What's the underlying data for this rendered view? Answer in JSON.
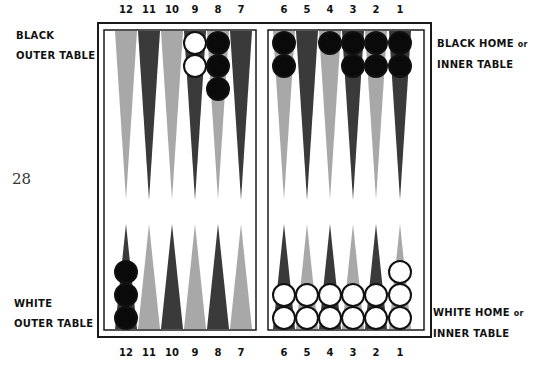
{
  "page_number": "28",
  "labels": {
    "black_outer": [
      "BLACK",
      "OUTER TABLE"
    ],
    "black_home": [
      "BLACK HOME",
      "or",
      "INNER TABLE"
    ],
    "white_outer": [
      "WHITE",
      "OUTER TABLE"
    ],
    "white_home": [
      "WHITE HOME",
      "or",
      "INNER TABLE"
    ]
  },
  "point_numbers": {
    "top": [
      "12",
      "11",
      "10",
      "9",
      "8",
      "7",
      "6",
      "5",
      "4",
      "3",
      "2",
      "1"
    ],
    "bottom": [
      "12",
      "11",
      "10",
      "9",
      "8",
      "7",
      "6",
      "5",
      "4",
      "3",
      "2",
      "1"
    ]
  },
  "colors": {
    "dark_point": "#3a3a3a",
    "light_point": "#a8a8a8",
    "black_checker": "#0a0a0a",
    "white_checker": "#ffffff",
    "frame": "#1a1a1a"
  },
  "board": {
    "top_points": [
      {
        "point": "12",
        "shade": "light",
        "checkers": []
      },
      {
        "point": "11",
        "shade": "dark",
        "checkers": []
      },
      {
        "point": "10",
        "shade": "light",
        "checkers": []
      },
      {
        "point": "9",
        "shade": "dark",
        "checkers": [
          "white",
          "white"
        ]
      },
      {
        "point": "8",
        "shade": "light",
        "checkers": [
          "black",
          "black",
          "black"
        ]
      },
      {
        "point": "7",
        "shade": "dark",
        "checkers": []
      },
      {
        "point": "6",
        "shade": "light",
        "checkers": [
          "black",
          "black"
        ]
      },
      {
        "point": "5",
        "shade": "dark",
        "checkers": []
      },
      {
        "point": "4",
        "shade": "light",
        "checkers": [
          "black"
        ]
      },
      {
        "point": "3",
        "shade": "dark",
        "checkers": [
          "black",
          "black"
        ]
      },
      {
        "point": "2",
        "shade": "light",
        "checkers": [
          "black",
          "black"
        ]
      },
      {
        "point": "1",
        "shade": "dark",
        "checkers": [
          "black",
          "black"
        ]
      }
    ],
    "bottom_points": [
      {
        "point": "12",
        "shade": "dark",
        "checkers": [
          "black",
          "black",
          "black"
        ]
      },
      {
        "point": "11",
        "shade": "light",
        "checkers": []
      },
      {
        "point": "10",
        "shade": "dark",
        "checkers": []
      },
      {
        "point": "9",
        "shade": "light",
        "checkers": []
      },
      {
        "point": "8",
        "shade": "dark",
        "checkers": []
      },
      {
        "point": "7",
        "shade": "light",
        "checkers": []
      },
      {
        "point": "6",
        "shade": "dark",
        "checkers": [
          "white",
          "white"
        ]
      },
      {
        "point": "5",
        "shade": "light",
        "checkers": [
          "white",
          "white"
        ]
      },
      {
        "point": "4",
        "shade": "dark",
        "checkers": [
          "white",
          "white"
        ]
      },
      {
        "point": "3",
        "shade": "light",
        "checkers": [
          "white",
          "white"
        ]
      },
      {
        "point": "2",
        "shade": "dark",
        "checkers": [
          "white",
          "white"
        ]
      },
      {
        "point": "1",
        "shade": "light",
        "checkers": [
          "white",
          "white",
          "white"
        ]
      }
    ]
  }
}
